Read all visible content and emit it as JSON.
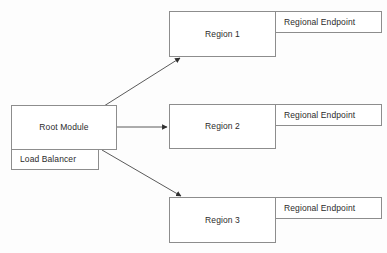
{
  "diagram": {
    "type": "block-diagram",
    "canvas": {
      "width": 387,
      "height": 253,
      "background": "#fdfdfd"
    },
    "style": {
      "box_fill": "#ffffff",
      "box_stroke": "#8d8d8d",
      "text_color": "#2b2b2b",
      "edge_stroke": "#5a5a5a"
    },
    "nodes": {
      "root_module": {
        "label": "Root Module"
      },
      "load_balancer": {
        "label": "Load Balancer"
      },
      "region_1": {
        "label": "Region 1"
      },
      "region_2": {
        "label": "Region 2"
      },
      "region_3": {
        "label": "Region 3"
      },
      "endpoint_1": {
        "label": "Regional Endpoint"
      },
      "endpoint_2": {
        "label": "Regional Endpoint"
      },
      "endpoint_3": {
        "label": "Regional Endpoint"
      }
    },
    "edges": [
      {
        "from": "root_module",
        "to": "region_1",
        "direction": "up-right",
        "arrowhead": true
      },
      {
        "from": "root_module",
        "to": "region_2",
        "direction": "right",
        "arrowhead": true
      },
      {
        "from": "root_module",
        "to": "region_3",
        "direction": "down-right",
        "arrowhead": true
      }
    ]
  }
}
